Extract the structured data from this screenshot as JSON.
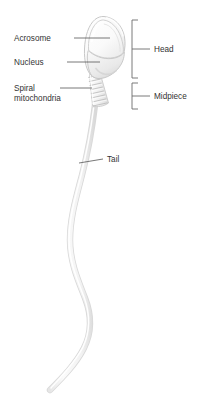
{
  "figure": {
    "background_color": "#ffffff",
    "text_color": "#333333",
    "leader_color": "#555555",
    "bracket_color": "#6b6b6b",
    "cell_fill_light": "#fdfdfd",
    "cell_fill_mid": "#f0f0f0",
    "cell_fill_shadow": "#dcdcdc",
    "cell_outline": "#c9c9c9"
  },
  "labels": {
    "acrosome": "Acrosome",
    "nucleus": "Nucleus",
    "spiral_mitochondria_line1": "Spiral",
    "spiral_mitochondria_line2": "mitochondria",
    "tail": "Tail",
    "head": "Head",
    "midpiece": "Midpiece"
  },
  "regions": [
    {
      "name": "Head",
      "bracket_top": 20,
      "bracket_bottom": 78
    },
    {
      "name": "Midpiece",
      "bracket_top": 83,
      "bracket_bottom": 109
    }
  ],
  "parts": [
    {
      "name": "Acrosome",
      "description": "cap covering anterior head"
    },
    {
      "name": "Nucleus",
      "description": "posterior head region"
    },
    {
      "name": "Spiral mitochondria",
      "description": "coiled bands in midpiece"
    },
    {
      "name": "Tail",
      "description": "long flagellum with S-curve"
    }
  ]
}
